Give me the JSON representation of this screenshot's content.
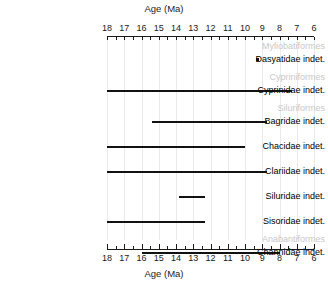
{
  "chart_data": {
    "type": "bar",
    "title": "",
    "xlabel": "Age (Ma)",
    "ylabel": "",
    "xlim": [
      18,
      6
    ],
    "axis_top_label": "Age (Ma)",
    "axis_bottom_label": "Age (Ma)",
    "grid": true,
    "legend": "none",
    "tick_labels": [
      "18",
      "17",
      "16",
      "15",
      "14",
      "13",
      "12",
      "11",
      "10",
      "9",
      "8",
      "7",
      "6"
    ],
    "tick_values": [
      18,
      17,
      16,
      15,
      14,
      13,
      12,
      11,
      10,
      9,
      8,
      7,
      6
    ],
    "minor_tick_step": 0.5,
    "axis_direction": "reversed (older left)",
    "color_range_bar": "#111111",
    "color_order_label": "#c8c8c8",
    "color_family_label": "#000000",
    "color_gridline": "#e9e9e9",
    "rows": [
      {
        "kind": "order",
        "label": "Myliobatiformes"
      },
      {
        "kind": "family",
        "label": "Dasyatidae indet.",
        "mark": "point",
        "x": 9.3
      },
      {
        "kind": "order",
        "label": "Cypriniformes"
      },
      {
        "kind": "family",
        "label": "Cyprinidae indet.",
        "mark": "range",
        "start": 18.0,
        "end": 7.3
      },
      {
        "kind": "order",
        "label": "Siluriformes"
      },
      {
        "kind": "family",
        "label": "Bagridae indet.",
        "mark": "range",
        "start": 15.4,
        "end": 8.7
      },
      {
        "kind": "family",
        "label": "Chacidae indet.",
        "mark": "range",
        "start": 18.0,
        "end": 10.0
      },
      {
        "kind": "family",
        "label": "Clariidae indet.",
        "mark": "range",
        "start": 18.0,
        "end": 8.7
      },
      {
        "kind": "family",
        "label": "Siluridae indet.",
        "mark": "range",
        "start": 13.8,
        "end": 12.3
      },
      {
        "kind": "family",
        "label": "Sisoridae indet.",
        "mark": "range",
        "start": 18.0,
        "end": 12.3
      },
      {
        "kind": "order",
        "label": "Anabantiformes"
      },
      {
        "kind": "family",
        "label": "Channidae indet.",
        "mark": "range",
        "start": 16.0,
        "end": 8.0
      }
    ]
  }
}
